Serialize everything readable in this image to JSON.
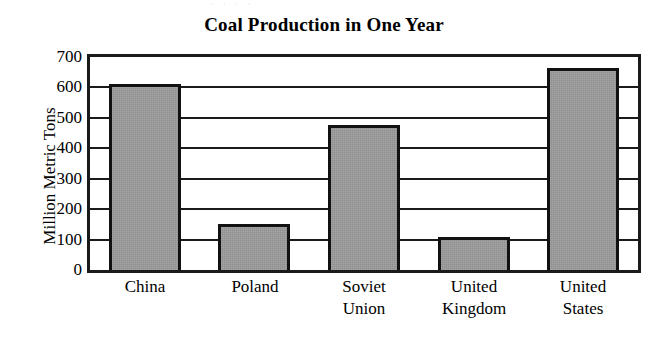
{
  "figure": {
    "ghost_remnant": "· ·   ·      ·",
    "title": "Coal Production in One Year"
  },
  "chart_data": {
    "type": "bar",
    "title": "Coal Production in One Year",
    "xlabel": "",
    "ylabel": "Million Metric Tons",
    "categories": [
      "China",
      "Poland",
      "Soviet Union",
      "United Kingdom",
      "United States"
    ],
    "values": [
      610,
      150,
      475,
      110,
      665
    ],
    "ylim": [
      0,
      700
    ],
    "yticks": [
      0,
      100,
      200,
      300,
      400,
      500,
      600,
      700
    ],
    "ytick_labels": [
      "0",
      "100",
      "200",
      "300",
      "400",
      "500",
      "600",
      "700"
    ],
    "grid": true,
    "legend": "none",
    "bar_color": "#9a9a9a",
    "bar_edge_color": "#111111",
    "axis_color": "#1a1a1a",
    "background_color": "#ffffff",
    "units": "Million Metric Tons"
  }
}
